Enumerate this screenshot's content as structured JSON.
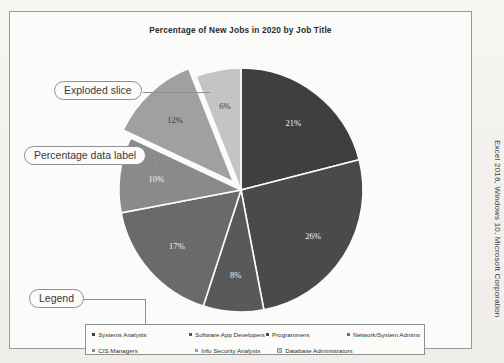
{
  "figure": {
    "title": "Percentage of New Jobs in 2020 by Job Title",
    "caption_vertical": "Excel 2016, Windows 10, Microsoft Corporation"
  },
  "annotations": [
    {
      "id": "exploded-slice",
      "label": "Exploded slice"
    },
    {
      "id": "percentage-data-label",
      "label": "Percentage data label"
    },
    {
      "id": "legend",
      "label": "Legend"
    }
  ],
  "legend": {
    "row1": [
      {
        "label": "Systems Analysts",
        "color": "#3f3f3f"
      },
      {
        "label": "Software App Developers",
        "color": "#595959"
      },
      {
        "label": "Programmers",
        "color": "#4a4a4a"
      },
      {
        "label": "Network/System Admins",
        "color": "#6f6f6f"
      }
    ],
    "row2": [
      {
        "label": "CIS Managers",
        "color": "#8a8a8a"
      },
      {
        "label": "Info Security Analysts",
        "color": "#a0a0a0"
      },
      {
        "label": "Database Administrators",
        "color": "#c4c4c4"
      }
    ]
  },
  "chart_data": {
    "type": "pie",
    "title": "Percentage of New Jobs in 2020 by Job Title",
    "xlabel": "",
    "ylabel": "",
    "legend_position": "bottom",
    "grid": false,
    "exploded_index": 5,
    "categories": [
      "Systems Analysts",
      "Software App Developers",
      "Programmers",
      "Network/System Admins",
      "CIS Managers",
      "Info Security Analysts",
      "Database Administrators"
    ],
    "values": [
      21,
      26,
      8,
      17,
      10,
      12,
      6
    ],
    "labels": [
      "21%",
      "26%",
      "8%",
      "17%",
      "10%",
      "12%",
      "6%"
    ],
    "colors": [
      "#3f3f3f",
      "#4a4a4a",
      "#595959",
      "#6a6a6a",
      "#8a8a8a",
      "#a0a0a0",
      "#c4c4c4"
    ]
  }
}
